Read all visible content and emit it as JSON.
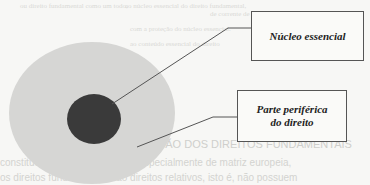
{
  "figure": {
    "outer_region": {
      "label_line1": "Parte periférica",
      "label_line2": "do direito",
      "color": "#d6d6d4"
    },
    "inner_region": {
      "label": "Núcleo essencial",
      "color": "#3a3a3a"
    }
  },
  "background_bleed": {
    "lines_top": [
      "ou direito fundamental como um todo,",
      "ao núcleo essencial do direito fundamental,",
      "de corrente de proteção absoluta",
      "com a proteção do núcleo essencial.",
      "ao conteúdo essencial do direito"
    ],
    "heading": "AÇÃO DOS DIREITOS FUNDAMENTAIS",
    "body_line1": "constitucional contemporânea, especialmente de matriz europeia,",
    "body_line2": "os direitos fundamentais são direitos relativos, isto é, não possuem"
  }
}
